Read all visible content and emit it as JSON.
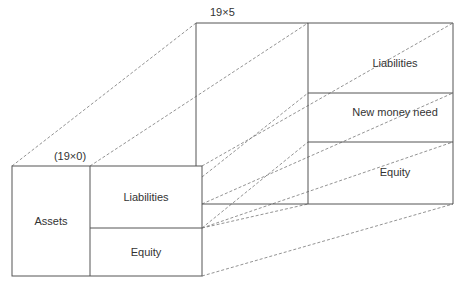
{
  "front_block": {
    "caption": "(19×0)",
    "assets_label": "Assets",
    "liabilities_label": "Liabilities",
    "equity_label": "Equity"
  },
  "back_block": {
    "caption": "19×5",
    "liabilities_label": "Liabilities",
    "new_money_label": "New money need",
    "equity_label": "Equity"
  },
  "colors": {
    "line": "#555555",
    "dashed": "#777777",
    "text": "#333333"
  }
}
